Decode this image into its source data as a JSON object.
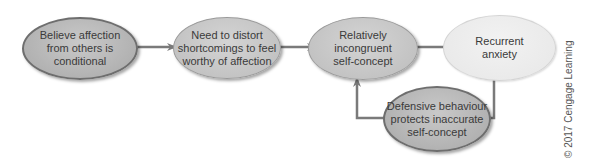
{
  "diagram": {
    "nodes": [
      {
        "id": "n1",
        "label": "Believe affection\nfrom others is\nconditional",
        "style": "dark"
      },
      {
        "id": "n2",
        "label": "Need to distort\nshortcomings to feel\nworthy of affection",
        "style": "mid"
      },
      {
        "id": "n3",
        "label": "Relatively\nincongruent\nself-concept",
        "style": "mid"
      },
      {
        "id": "n4",
        "label": "Recurrent\nanxiety",
        "style": "light"
      },
      {
        "id": "n5",
        "label": "Defensive behaviour\nprotects inaccurate\nself-concept",
        "style": "dark"
      }
    ],
    "edges": [
      {
        "from": "n1",
        "to": "n2"
      },
      {
        "from": "n2",
        "to": "n3"
      },
      {
        "from": "n3",
        "to": "n4"
      },
      {
        "from": "n4",
        "to": "n5"
      },
      {
        "from": "n5",
        "to": "n3"
      }
    ],
    "colors": {
      "arrow": "#7a7a7a",
      "dark_fill": "#b2b2b2",
      "light_fill": "#ebebeb",
      "text": "#3a3a3a"
    }
  },
  "credit": "© 2017 Cengage Learning"
}
